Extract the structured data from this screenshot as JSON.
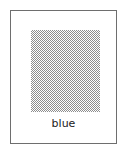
{
  "card": {
    "swatch": {
      "pattern": "dithered-halftone",
      "dot_color": "#7a7a7a",
      "background_color": "#ffffff"
    },
    "label": "blue",
    "border_color": "#6e6e6e"
  }
}
